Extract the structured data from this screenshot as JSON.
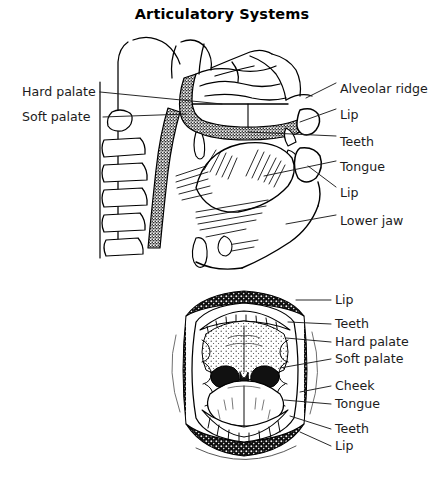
{
  "figure": {
    "title": "Articulatory Systems",
    "ink_color": "#000000",
    "background_color": "#ffffff"
  },
  "upper_diagram": {
    "name": "mid-sagittal head section",
    "labels_left": [
      {
        "text": "Hard palate",
        "x": 22,
        "y": 92
      },
      {
        "text": "Soft palate",
        "x": 22,
        "y": 116
      }
    ],
    "labels_right": [
      {
        "text": "Alveolar ridge",
        "x": 340,
        "y": 83
      },
      {
        "text": "Lip",
        "x": 340,
        "y": 109
      },
      {
        "text": "Teeth",
        "x": 340,
        "y": 136
      },
      {
        "text": "Tongue",
        "x": 340,
        "y": 161
      },
      {
        "text": "Lip",
        "x": 340,
        "y": 187
      },
      {
        "text": "Lower jaw",
        "x": 340,
        "y": 215
      }
    ]
  },
  "lower_diagram": {
    "name": "open mouth frontal view",
    "labels_right": [
      {
        "text": "Lip",
        "x": 335,
        "y": 300
      },
      {
        "text": "Teeth",
        "x": 335,
        "y": 324
      },
      {
        "text": "Hard palate",
        "x": 335,
        "y": 342
      },
      {
        "text": "Soft palate",
        "x": 335,
        "y": 359
      },
      {
        "text": "Cheek",
        "x": 335,
        "y": 386
      },
      {
        "text": "Tongue",
        "x": 335,
        "y": 404
      },
      {
        "text": "Teeth",
        "x": 335,
        "y": 429
      },
      {
        "text": "Lip",
        "x": 335,
        "y": 446
      }
    ]
  }
}
